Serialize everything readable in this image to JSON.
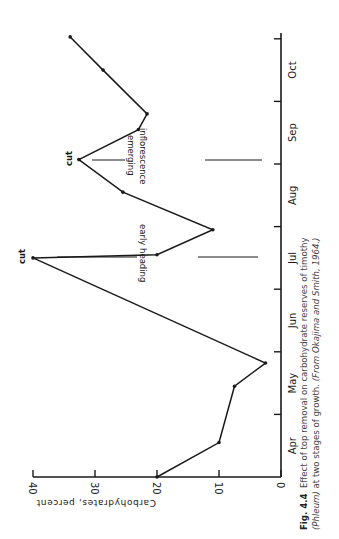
{
  "chart_data": {
    "type": "line",
    "title": "Effect of top removal on carbohydrate reserves of timothy (Phleum) at two stages of growth.",
    "xlabel": "",
    "ylabel": "Carbohydrates, percent",
    "orientation": "rotated 90° counter-clockwise (months run bottom-to-top, values increase leftward)",
    "categories": [
      "Apr",
      "May",
      "Jun",
      "Jul",
      "Aug",
      "Sep",
      "Oct"
    ],
    "ylim": [
      0,
      40
    ],
    "yticks": [
      0,
      10,
      20,
      30,
      40
    ],
    "grid": false,
    "series": [
      {
        "name": "Carbohydrate reserves",
        "x": [
          0.0,
          0.55,
          1.45,
          1.8,
          3.5,
          4.4,
          4.8,
          5.4,
          6.0,
          6.6,
          6.95,
          7.5,
          8.2,
          8.7,
          9.4,
          10.0
        ],
        "values": [
          20,
          10,
          7.5,
          2.5,
          40,
          20,
          11,
          25.5,
          32.6,
          23,
          21.6,
          28.7,
          34,
          34,
          34,
          34
        ]
      }
    ],
    "points": [
      {
        "month_pos": 0.0,
        "value": 20
      },
      {
        "month_pos": 0.55,
        "value": 10
      },
      {
        "month_pos": 1.45,
        "value": 7.5
      },
      {
        "month_pos": 1.82,
        "value": 2.5
      },
      {
        "month_pos": 3.5,
        "value": 40,
        "label": "cut"
      },
      {
        "month_pos": 3.55,
        "value": 20
      },
      {
        "month_pos": 3.95,
        "value": 11
      },
      {
        "month_pos": 4.55,
        "value": 25.5
      },
      {
        "month_pos": 5.07,
        "value": 32.6,
        "label": "cut"
      },
      {
        "month_pos": 5.55,
        "value": 23
      },
      {
        "month_pos": 5.8,
        "value": 21.6
      },
      {
        "month_pos": 6.5,
        "value": 28.7
      },
      {
        "month_pos": 7.03,
        "value": 34
      }
    ],
    "annotations": [
      {
        "text": "cut",
        "at_value": 40,
        "note": "early heading"
      },
      {
        "text": "cut",
        "at_value": 32.6,
        "note": "inflorescence emerging"
      }
    ]
  },
  "figure": {
    "y_axis_label": "Carbohydrates, percent",
    "y_tick_labels": [
      "0",
      "10",
      "20",
      "30",
      "40"
    ],
    "month_labels": [
      "Apr",
      "May",
      "Jun",
      "Jul",
      "Aug",
      "Sep",
      "Oct"
    ],
    "cut_label_1": "cut",
    "cut_label_2": "cut",
    "annotation_1": "early heading",
    "annotation_2_line1": "inflorescence",
    "annotation_2_line2": "emerging"
  },
  "caption": {
    "fig_number": "Fig. 4.4",
    "text_line1": "Effect of top removal on carbohydrate reserves of timothy",
    "text_line2_italic_a": "(Phleum)",
    "text_line2": " at two stages of growth. ",
    "text_line2_italic_b": "(From Okajima and Smith, 1964.)"
  }
}
